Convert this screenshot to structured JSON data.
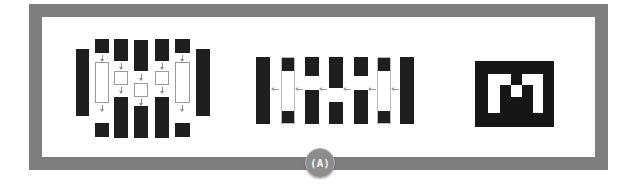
{
  "figure": {
    "label": "(A)",
    "frame_color": "#7f7f7f",
    "panels": [
      {
        "name": "encoder-decoder-block-diagram",
        "description": "Symmetric block diagram: dark blocks with down arrows into white hollow blocks, flanked by two tall dark bars"
      },
      {
        "name": "column-bar-diagram",
        "description": "Seven vertical bars with black and white segments, left-pointing arrows between adjacent bars",
        "bars": [
          {
            "segments": [
              [
                "black",
                67
              ]
            ]
          },
          {
            "segments": [
              [
                "black",
                13
              ],
              [
                "white",
                40
              ],
              [
                "black",
                14
              ]
            ]
          },
          {
            "segments": [
              [
                "black",
                19
              ],
              [
                "white",
                14
              ],
              [
                "black",
                34
              ]
            ]
          },
          {
            "segments": [
              [
                "black",
                31
              ],
              [
                "white",
                14
              ],
              [
                "black",
                22
              ]
            ]
          },
          {
            "segments": [
              [
                "black",
                19
              ],
              [
                "white",
                14
              ],
              [
                "black",
                34
              ]
            ]
          },
          {
            "segments": [
              [
                "black",
                13
              ],
              [
                "white",
                40
              ],
              [
                "black",
                14
              ]
            ]
          },
          {
            "segments": [
              [
                "black",
                67
              ]
            ]
          }
        ]
      },
      {
        "name": "pixel-m-logo",
        "description": "Black square containing a pixelated white letter M",
        "letter": "M"
      }
    ]
  },
  "colors": {
    "block": "#1f1f1f",
    "frame": "#7f7f7f",
    "badge": "#8c8c8c",
    "arrow": "#8a8a8a"
  }
}
